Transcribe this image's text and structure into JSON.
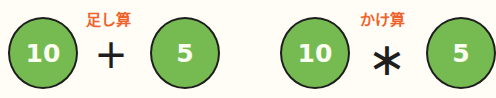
{
  "colors": {
    "circle_fill": "#76bb51",
    "circle_border": "#1e1e1e",
    "label": "#f0622c",
    "background": "#fffdf6"
  },
  "addition": {
    "label": "足し算",
    "left_value": "10",
    "operator": "+",
    "right_value": "5"
  },
  "multiplication": {
    "label": "かけ算",
    "left_value": "10",
    "operator": "∗",
    "right_value": "5"
  }
}
